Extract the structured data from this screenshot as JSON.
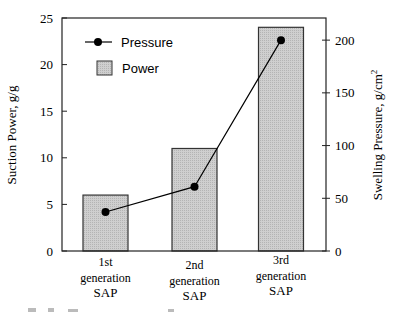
{
  "chart_data": {
    "type": "bar",
    "title": "",
    "categories": [
      "1st generation SAP",
      "2nd generation SAP",
      "3rd generation SAP"
    ],
    "category_lines": [
      [
        "1st",
        "generation",
        "SAP"
      ],
      [
        "2nd",
        "generation",
        "SAP"
      ],
      [
        "3rd",
        "generation",
        "SAP"
      ]
    ],
    "series": [
      {
        "name": "Power",
        "type": "bar",
        "axis": "left",
        "values": [
          6,
          11,
          24
        ],
        "color": "#c8c8c8"
      },
      {
        "name": "Pressure",
        "type": "line",
        "axis": "right",
        "values": [
          37,
          61,
          200
        ],
        "color": "#000000"
      }
    ],
    "xlabel": "",
    "ylabel": "Suction Power, g/g",
    "ylabel_right": "Swelling Pressure, g/cm",
    "ylabel_right_superscript": "2",
    "ylim": [
      0,
      25
    ],
    "ylim_right": [
      0,
      221
    ],
    "yticks": [
      0,
      5,
      10,
      15,
      20,
      25
    ],
    "yticks_right": [
      0,
      50,
      100,
      150,
      200
    ],
    "grid": false,
    "legend": {
      "position": "upper-left",
      "entries": [
        "Pressure",
        "Power"
      ]
    }
  }
}
